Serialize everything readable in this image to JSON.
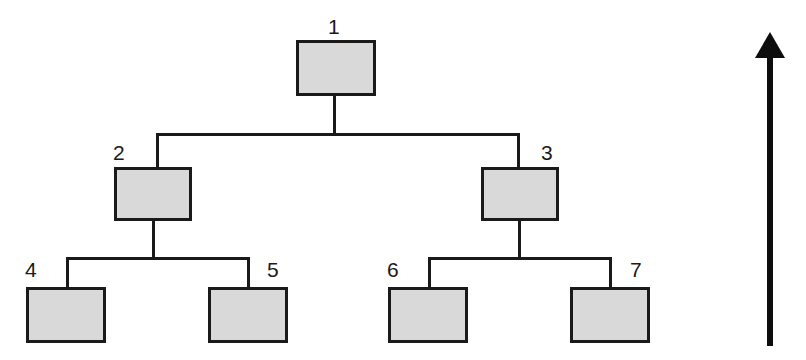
{
  "diagram": {
    "type": "tree-diagram",
    "colors": {
      "node_fill": "#d9d9d9",
      "node_border": "#1a1a1a",
      "edge": "#1a1a1a",
      "arrow": "#0d0d0d",
      "background": "#ffffff"
    },
    "nodes": [
      {
        "id": "1",
        "label": "1",
        "level": 0,
        "x": 296,
        "y": 40,
        "w": 80,
        "h": 56,
        "label_x": 328,
        "label_y": 16
      },
      {
        "id": "2",
        "label": "2",
        "level": 1,
        "x": 114,
        "y": 167,
        "w": 78,
        "h": 54,
        "label_x": 113,
        "label_y": 142
      },
      {
        "id": "3",
        "label": "3",
        "level": 1,
        "x": 481,
        "y": 167,
        "w": 78,
        "h": 54,
        "label_x": 541,
        "label_y": 142
      },
      {
        "id": "4",
        "label": "4",
        "level": 2,
        "x": 26,
        "y": 287,
        "w": 80,
        "h": 56,
        "label_x": 25,
        "label_y": 259
      },
      {
        "id": "5",
        "label": "5",
        "level": 2,
        "x": 208,
        "y": 287,
        "w": 80,
        "h": 56,
        "label_x": 267,
        "label_y": 259
      },
      {
        "id": "6",
        "label": "6",
        "level": 2,
        "x": 388,
        "y": 287,
        "w": 80,
        "h": 56,
        "label_x": 387,
        "label_y": 259
      },
      {
        "id": "7",
        "label": "7",
        "level": 2,
        "x": 570,
        "y": 287,
        "w": 80,
        "h": 56,
        "label_x": 630,
        "label_y": 259
      }
    ],
    "edges": [
      {
        "from": "1",
        "to": "2"
      },
      {
        "from": "1",
        "to": "3"
      },
      {
        "from": "2",
        "to": "4"
      },
      {
        "from": "2",
        "to": "5"
      },
      {
        "from": "3",
        "to": "6"
      },
      {
        "from": "3",
        "to": "7"
      }
    ],
    "connectors": [
      {
        "name": "root-drop-stub",
        "x": 333,
        "y": 96,
        "w": 3,
        "h": 38
      },
      {
        "name": "level1-horizontal-bus",
        "x": 156,
        "y": 133,
        "w": 364,
        "h": 3
      },
      {
        "name": "level1-left-drop",
        "x": 156,
        "y": 133,
        "w": 3,
        "h": 36
      },
      {
        "name": "level1-right-drop",
        "x": 517,
        "y": 133,
        "w": 3,
        "h": 36
      },
      {
        "name": "node2-drop-stub",
        "x": 152,
        "y": 221,
        "w": 3,
        "h": 37
      },
      {
        "name": "level2-left-bus",
        "x": 66,
        "y": 257,
        "w": 184,
        "h": 3
      },
      {
        "name": "level2-leaf4-drop",
        "x": 66,
        "y": 257,
        "w": 3,
        "h": 32
      },
      {
        "name": "level2-leaf5-drop",
        "x": 247,
        "y": 257,
        "w": 3,
        "h": 32
      },
      {
        "name": "node3-drop-stub",
        "x": 518,
        "y": 221,
        "w": 3,
        "h": 37
      },
      {
        "name": "level2-right-bus",
        "x": 428,
        "y": 257,
        "w": 184,
        "h": 3
      },
      {
        "name": "level2-leaf6-drop",
        "x": 428,
        "y": 257,
        "w": 3,
        "h": 32
      },
      {
        "name": "level2-leaf7-drop",
        "x": 609,
        "y": 257,
        "w": 3,
        "h": 32
      }
    ],
    "arrow": {
      "name": "upward-direction-arrow",
      "direction": "up",
      "tip_x": 770,
      "tip_y": 32,
      "tail_y": 346,
      "shaft_width": 6,
      "head_width": 30,
      "head_height": 26
    }
  }
}
